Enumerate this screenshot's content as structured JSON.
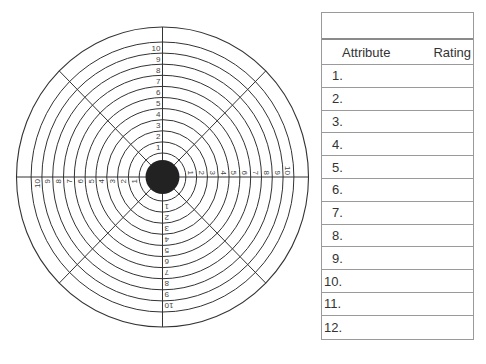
{
  "target": {
    "ring_labels": [
      "1",
      "2",
      "3",
      "4",
      "5",
      "6",
      "7",
      "8",
      "9",
      "10"
    ],
    "center_color": "#222222",
    "line_color": "#333333"
  },
  "table": {
    "title": "",
    "headers": {
      "attribute": "Attribute",
      "rating": "Rating"
    },
    "rows": [
      "1.",
      "2.",
      "3.",
      "4.",
      "5.",
      "6.",
      "7.",
      "8.",
      "9.",
      "10.",
      "11.",
      "12."
    ]
  }
}
